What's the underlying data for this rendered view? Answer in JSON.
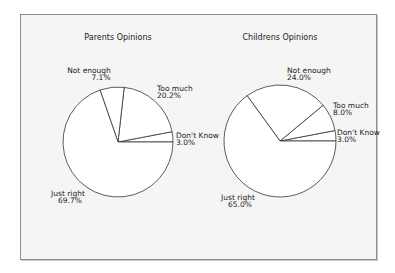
{
  "chart_data": [
    {
      "type": "pie",
      "title": "Parents Opinions",
      "start_angle_deg": 0,
      "direction": "counterclockwise",
      "slices": [
        {
          "label": "Don't Know",
          "value": 3.0,
          "pct_text": "3.0%"
        },
        {
          "label": "Too much",
          "value": 20.2,
          "pct_text": "20.2%"
        },
        {
          "label": "Not enough",
          "value": 7.1,
          "pct_text": "7.1%"
        },
        {
          "label": "Just right",
          "value": 69.7,
          "pct_text": "69.7%"
        }
      ]
    },
    {
      "type": "pie",
      "title": "Childrens Opinions",
      "start_angle_deg": 0,
      "direction": "counterclockwise",
      "slices": [
        {
          "label": "Don't Know",
          "value": 3.0,
          "pct_text": "3.0%"
        },
        {
          "label": "Too much",
          "value": 8.0,
          "pct_text": "8.0%"
        },
        {
          "label": "Not enough",
          "value": 24.0,
          "pct_text": "24.0%"
        },
        {
          "label": "Just right",
          "value": 65.0,
          "pct_text": "65.0%"
        }
      ]
    }
  ],
  "style": {
    "frame_bg": "#f5f5f5",
    "frame_border": "#8c8c8c",
    "slice_fill": "#ffffff",
    "slice_stroke": "#333333",
    "text_color": "#222222"
  }
}
